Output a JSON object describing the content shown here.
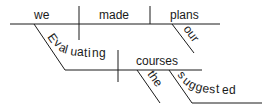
{
  "diagram": {
    "type": "sentence-diagram",
    "sentence": "Evaluating the suggested courses, we made our plans",
    "words": {
      "subject": "we",
      "verb": "made",
      "object": "plans",
      "object_modifier": "our",
      "participle": "Evaluating",
      "participle_object": "courses",
      "article": "the",
      "adjective": "suggested"
    },
    "colors": {
      "ink": "#1a1a1a",
      "background": "#ffffff"
    }
  }
}
